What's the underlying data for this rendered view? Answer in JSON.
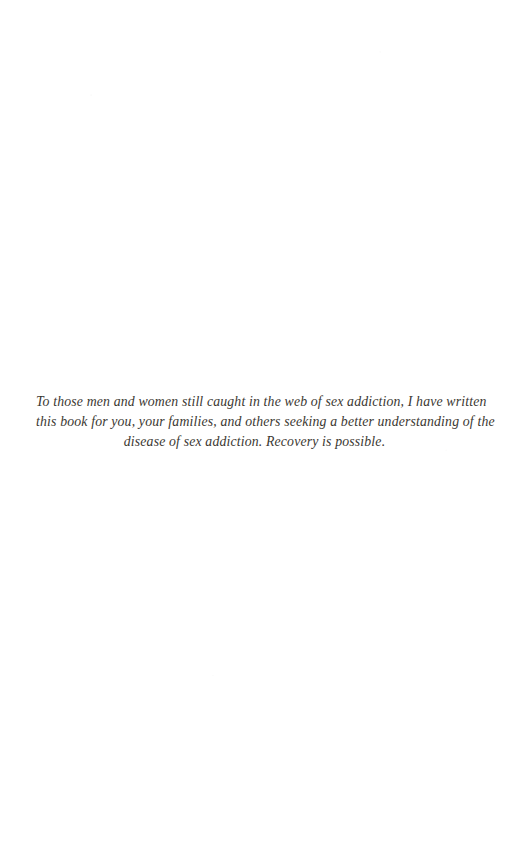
{
  "page": {
    "type": "book-dedication-page",
    "background_color": "#ffffff",
    "text_color": "#3b3832"
  },
  "dedication": {
    "full_text": "To those men and women still caught in the web of sex addiction, I have written this book for you, your families, and others seeking a better understanding of the disease of sex addiction. Recovery is possible.",
    "lines": [
      "To those men and women still caught in the web of sex addiction, I have written",
      "this book for you, your families, and others seeking a better understanding of the",
      "disease of sex addiction. Recovery is possible."
    ]
  }
}
